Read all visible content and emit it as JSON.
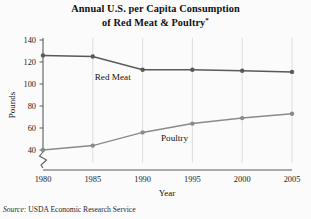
{
  "figure": {
    "title_line1": "Annual U.S. per Capita Consumption",
    "title_line2": "of Red Meat & Poultry",
    "title_footnote_mark": "*",
    "source_label": "Source:",
    "source_text": " USDA Economic Research Service"
  },
  "chart_data": {
    "type": "line",
    "title": "Annual U.S. per Capita Consumption of Red Meat & Poultry*",
    "xlabel": "Year",
    "ylabel": "Pounds",
    "x": [
      1980,
      1985,
      1990,
      1995,
      2000,
      2005
    ],
    "xtick_labels": [
      "1980",
      "1985",
      "1990",
      "1995",
      "2000",
      "2005"
    ],
    "ytick_labels": [
      "40",
      "60",
      "80",
      "100",
      "120",
      "140"
    ],
    "yticks": [
      40,
      60,
      80,
      100,
      120,
      140
    ],
    "ylim": [
      36,
      140
    ],
    "xlim": [
      1980,
      2005
    ],
    "y_axis_break": true,
    "grid": "vertical-only",
    "legend_position": "inline-labels",
    "series": [
      {
        "name": "Red Meat",
        "color": "#595959",
        "marker": "circle",
        "label_x": 1987.0,
        "label_y": 104,
        "values": [
          126,
          125,
          113,
          113,
          112,
          111
        ]
      },
      {
        "name": "Poultry",
        "color": "#8a8a8a",
        "marker": "circle",
        "label_x": 1993.2,
        "label_y": 48,
        "values": [
          40,
          44,
          56,
          64,
          69,
          73
        ]
      }
    ]
  }
}
